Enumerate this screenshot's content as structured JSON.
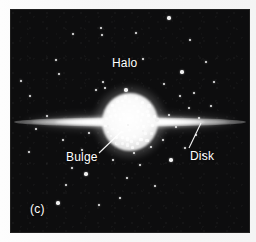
{
  "figure": {
    "panel_label": "(c)",
    "caption_alt": "Edge-on view of a spiral galaxy showing halo, bulge and disk",
    "background_color": "#0d0d0e",
    "margin_color": "#fbfbfb",
    "star_color": "#f0f0f0",
    "label_color": "#ffffff",
    "width": 256,
    "height": 242
  },
  "labels": {
    "halo": "Halo",
    "bulge": "Bulge",
    "disk": "Disk"
  },
  "chart_data": {
    "type": "scatter",
    "title": "(c)",
    "xlabel": "",
    "ylabel": "",
    "annotations": [
      "Halo",
      "Bulge",
      "Disk",
      "(c)"
    ],
    "components": [
      {
        "name": "Disk",
        "shape": "lens",
        "cx": 119,
        "cy": 112,
        "rx": 116,
        "ry": 5
      },
      {
        "name": "Bulge",
        "shape": "sphere",
        "cx": 119,
        "cy": 112,
        "r": 28
      },
      {
        "name": "Halo",
        "shape": "scattered-point-cloud",
        "count": 54
      }
    ],
    "halo_points": [
      [
        169,
        18
      ],
      [
        101,
        28
      ],
      [
        102,
        35
      ],
      [
        73,
        34
      ],
      [
        136,
        33
      ],
      [
        56,
        60
      ],
      [
        190,
        40
      ],
      [
        126,
        90
      ],
      [
        103,
        82
      ],
      [
        105,
        88
      ],
      [
        96,
        90
      ],
      [
        21,
        81
      ],
      [
        30,
        96
      ],
      [
        164,
        84
      ],
      [
        182,
        72
      ],
      [
        194,
        93
      ],
      [
        206,
        62
      ],
      [
        143,
        59
      ],
      [
        59,
        74
      ],
      [
        47,
        116
      ],
      [
        36,
        129
      ],
      [
        157,
        120
      ],
      [
        169,
        115
      ],
      [
        176,
        127
      ],
      [
        143,
        131
      ],
      [
        163,
        140
      ],
      [
        151,
        147
      ],
      [
        128,
        125
      ],
      [
        118,
        143
      ],
      [
        108,
        126
      ],
      [
        134,
        153
      ],
      [
        63,
        140
      ],
      [
        82,
        150
      ],
      [
        29,
        152
      ],
      [
        72,
        168
      ],
      [
        86,
        174
      ],
      [
        66,
        185
      ],
      [
        127,
        178
      ],
      [
        140,
        165
      ],
      [
        120,
        198
      ],
      [
        99,
        205
      ],
      [
        155,
        186
      ],
      [
        171,
        160
      ],
      [
        185,
        148
      ],
      [
        196,
        135
      ],
      [
        199,
        118
      ],
      [
        211,
        106
      ],
      [
        189,
        108
      ],
      [
        203,
        155
      ],
      [
        58,
        203
      ],
      [
        89,
        133
      ],
      [
        113,
        160
      ],
      [
        180,
        96
      ],
      [
        214,
        82
      ]
    ]
  }
}
